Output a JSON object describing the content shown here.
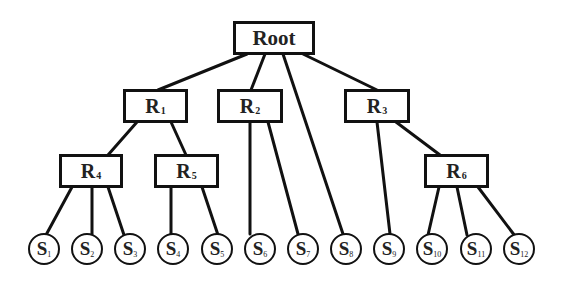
{
  "diagram": {
    "type": "tree",
    "root": {
      "id": "root",
      "label": "Root"
    },
    "internal_nodes": [
      {
        "id": "R1",
        "label": "R",
        "sub": "1",
        "parent": "root"
      },
      {
        "id": "R2",
        "label": "R",
        "sub": "2",
        "parent": "root"
      },
      {
        "id": "R3",
        "label": "R",
        "sub": "3",
        "parent": "root"
      },
      {
        "id": "R4",
        "label": "R",
        "sub": "4",
        "parent": "R1"
      },
      {
        "id": "R5",
        "label": "R",
        "sub": "5",
        "parent": "R1"
      },
      {
        "id": "R6",
        "label": "R",
        "sub": "6",
        "parent": "R3"
      }
    ],
    "leaves": [
      {
        "id": "S1",
        "label": "S",
        "sub": "1",
        "parent": "R4"
      },
      {
        "id": "S2",
        "label": "S",
        "sub": "2",
        "parent": "R4"
      },
      {
        "id": "S3",
        "label": "S",
        "sub": "3",
        "parent": "R4"
      },
      {
        "id": "S4",
        "label": "S",
        "sub": "4",
        "parent": "R5"
      },
      {
        "id": "S5",
        "label": "S",
        "sub": "5",
        "parent": "R5"
      },
      {
        "id": "S6",
        "label": "S",
        "sub": "6",
        "parent": "R2"
      },
      {
        "id": "S7",
        "label": "S",
        "sub": "7",
        "parent": "R2"
      },
      {
        "id": "S8",
        "label": "S",
        "sub": "8",
        "parent": "root"
      },
      {
        "id": "S9",
        "label": "S",
        "sub": "9",
        "parent": "R3"
      },
      {
        "id": "S10",
        "label": "S",
        "sub": "10",
        "parent": "R6"
      },
      {
        "id": "S11",
        "label": "S",
        "sub": "11",
        "parent": "R6"
      },
      {
        "id": "S12",
        "label": "S",
        "sub": "12",
        "parent": "R6"
      }
    ],
    "colors": {
      "stroke": "#111111",
      "text": "#222222",
      "background": "#ffffff"
    }
  }
}
